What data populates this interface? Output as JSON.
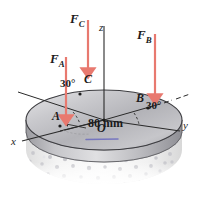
{
  "figure": {
    "background_color": "#ffffff",
    "arrow_color": "#e8796f",
    "line_color": "#2a2a2a",
    "disk_color": "#b9b9bc",
    "base_color": "#f2f2f2",
    "speckle_color": "#c8c8cc",
    "rim_highlight_color": "#6b6bbf"
  },
  "axes": {
    "x_label": "x",
    "y_label": "y",
    "z_label": "z"
  },
  "forces": [
    {
      "id": "force-a",
      "label": "F",
      "subscript": "A",
      "applied_at": "A",
      "direction": "downward"
    },
    {
      "id": "force-b",
      "label": "F",
      "subscript": "B",
      "applied_at": "B",
      "direction": "downward"
    },
    {
      "id": "force-c",
      "label": "F",
      "subscript": "C",
      "applied_at": "C",
      "direction": "downward"
    }
  ],
  "points": {
    "origin": "O",
    "a": "A",
    "b": "B",
    "c": "C"
  },
  "angles": [
    {
      "id": "angle-c",
      "value": "30°",
      "between": "x-axis and OC"
    },
    {
      "id": "angle-b",
      "value": "30°",
      "between": "y-axis and OB"
    }
  ],
  "dimensions": [
    {
      "id": "radius",
      "value": "80 mm",
      "measures": "disk radius from O to A"
    }
  ]
}
